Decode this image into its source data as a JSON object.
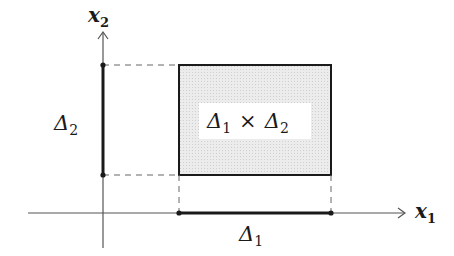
{
  "diagram": {
    "type": "cartesian-product-rectangle",
    "axes": {
      "x_label": "x",
      "x_label_sub": "1",
      "y_label": "x",
      "y_label_sub": "2"
    },
    "intervals": {
      "delta1": {
        "symbol": "Δ",
        "sub": "1"
      },
      "delta2": {
        "symbol": "Δ",
        "sub": "2"
      }
    },
    "rectangle": {
      "label_part1": "Δ",
      "label_sub1": "1",
      "times": "×",
      "label_part2": "Δ",
      "label_sub2": "2",
      "fill_color": "#e6e6e6",
      "stroke_color": "#1a1a1a"
    },
    "colors": {
      "axis": "#555555",
      "interval": "#1a1a1a",
      "dashed": "#666666"
    }
  }
}
